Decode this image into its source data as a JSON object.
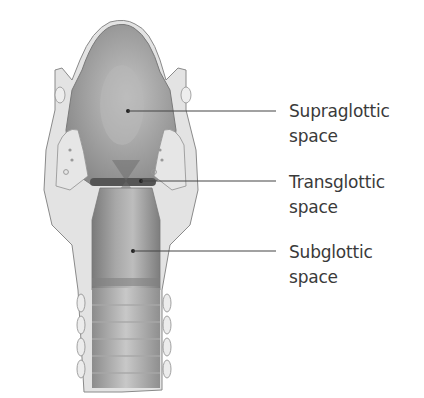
{
  "figure": {
    "colors": {
      "background": "#ffffff",
      "lumen_dark": "#6e6e6e",
      "lumen_mid": "#9a9a9a",
      "lumen_light": "#c9c9c9",
      "tissue": "#e2e2e2",
      "outline": "#8a8a8a",
      "leader_line": "#444444",
      "label_text": "#3a3a3a"
    },
    "labels": [
      {
        "line1": "Supraglottic",
        "line2": "space",
        "dot": [
          128,
          111
        ],
        "line_end": [
          276,
          111
        ],
        "text_top": 99
      },
      {
        "line1": "Transglottic",
        "line2": "space",
        "dot": [
          141,
          181
        ],
        "line_end": [
          276,
          181
        ],
        "text_top": 170
      },
      {
        "line1": "Subglottic",
        "line2": "space",
        "dot": [
          133,
          251
        ],
        "line_end": [
          276,
          251
        ],
        "text_top": 240
      }
    ]
  }
}
